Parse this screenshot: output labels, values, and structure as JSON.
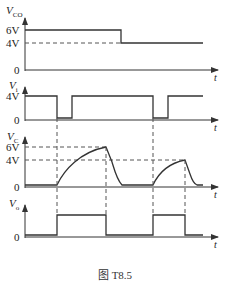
{
  "figure": {
    "caption": "图 T8.5",
    "time_axis_label": "t",
    "zero_label": "0",
    "panels": [
      {
        "id": "vco",
        "name": "V",
        "sub": "CO",
        "levels": [
          "6V",
          "4V"
        ]
      },
      {
        "id": "vi",
        "name": "V",
        "sub": "i",
        "levels": [
          "4V"
        ]
      },
      {
        "id": "vc",
        "name": "V",
        "sub": "C",
        "levels": [
          "6V",
          "4V"
        ]
      },
      {
        "id": "vo",
        "name": "V",
        "sub": "o",
        "levels": []
      }
    ]
  },
  "colors": {
    "line": "#333333",
    "dash": "#555555",
    "text": "#222222"
  }
}
